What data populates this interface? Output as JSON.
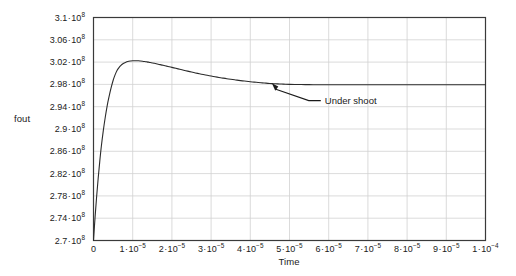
{
  "chart_data": {
    "type": "line",
    "title": "",
    "xlabel": "Time",
    "ylabel": "fout",
    "xlim": [
      0,
      0.0001
    ],
    "ylim": [
      270000000,
      310000000
    ],
    "grid": true,
    "legend": null,
    "x_tick_labels": [
      "0",
      "1·10⁻⁵",
      "2·10⁻⁵",
      "3·10⁻⁵",
      "4·10⁻⁵",
      "5·10⁻⁵",
      "6·10⁻⁵",
      "7·10⁻⁵",
      "8·10⁻⁵",
      "9·10⁻⁵",
      "1·10⁻⁴"
    ],
    "x_tick_values": [
      0,
      1e-05,
      2e-05,
      3e-05,
      4e-05,
      5e-05,
      6e-05,
      7e-05,
      8e-05,
      9e-05,
      0.0001
    ],
    "y_tick_labels": [
      "2.7·10⁸",
      "2.74·10⁸",
      "2.78·10⁸",
      "2.82·10⁸",
      "2.86·10⁸",
      "2.9·10⁸",
      "2.94·10⁸",
      "2.98·10⁸",
      "3.02·10⁸",
      "3.06·10⁸",
      "3.1·10⁸"
    ],
    "y_tick_values": [
      270000000,
      274000000,
      278000000,
      282000000,
      286000000,
      290000000,
      294000000,
      298000000,
      302000000,
      306000000,
      310000000
    ],
    "series": [
      {
        "name": "fout",
        "color": "#2b2b2b",
        "x": [
          0,
          4e-07,
          8e-07,
          1.2e-06,
          1.6e-06,
          2e-06,
          2.5e-06,
          3e-06,
          3.5e-06,
          4e-06,
          4.5e-06,
          5e-06,
          5.5e-06,
          6e-06,
          6.5e-06,
          7e-06,
          7.5e-06,
          8e-06,
          8.5e-06,
          9e-06,
          9.5e-06,
          1e-05,
          1.05e-05,
          1.1e-05,
          1.15e-05,
          1.2e-05,
          1.25e-05,
          1.3e-05,
          1.35e-05,
          1.4e-05,
          1.45e-05,
          1.5e-05,
          1.55e-05,
          1.6e-05,
          1.65e-05,
          1.7e-05,
          1.75e-05,
          1.8e-05,
          1.85e-05,
          1.9e-05,
          2e-05,
          2.1e-05,
          2.2e-05,
          2.3e-05,
          2.4e-05,
          2.5e-05,
          2.6e-05,
          2.7e-05,
          2.8e-05,
          2.9e-05,
          3e-05,
          3.1e-05,
          3.2e-05,
          3.3e-05,
          3.4e-05,
          3.5e-05,
          3.6e-05,
          3.7e-05,
          3.8e-05,
          3.9e-05,
          4e-05,
          4.1e-05,
          4.2e-05,
          4.3e-05,
          4.4e-05,
          4.5e-05,
          4.6e-05,
          4.7e-05,
          4.8e-05,
          4.9e-05,
          5e-05,
          5.2e-05,
          5.4e-05,
          5.6e-05,
          5.8e-05,
          6e-05,
          6.5e-05,
          7e-05,
          7.5e-05,
          8e-05,
          8.5e-05,
          9e-05,
          9.5e-05,
          0.0001
        ],
        "y": [
          270000000,
          274200000,
          277900000,
          281200000,
          284200000,
          286900000,
          289700000,
          292100000,
          294200000,
          295900000,
          297400000,
          298700000,
          299700000,
          300500000,
          301000000,
          301400000,
          301700000,
          301900000,
          302050000,
          302150000,
          302200000,
          302230000,
          302240000,
          302240000,
          302230000,
          302200000,
          302160000,
          302110000,
          302050000,
          301990000,
          301920000,
          301850000,
          301780000,
          301700000,
          301620000,
          301540000,
          301460000,
          301380000,
          301300000,
          301220000,
          301050000,
          300880000,
          300710000,
          300540000,
          300380000,
          300220000,
          300060000,
          299910000,
          299770000,
          299630000,
          299500000,
          299370000,
          299250000,
          299130000,
          299020000,
          298920000,
          298820000,
          298730000,
          298640000,
          298560000,
          298480000,
          298410000,
          298340000,
          298280000,
          298220000,
          298170000,
          298130000,
          298090000,
          298060000,
          298030000,
          298010000,
          297980000,
          297960000,
          297950000,
          297950000,
          297950000,
          297950000,
          297950000,
          297950000,
          297950000,
          297950000,
          297950000,
          297950000,
          297950000
        ]
      }
    ],
    "annotations": [
      {
        "name": "under-shoot",
        "text": "Under shoot",
        "target_x": 4.55e-05,
        "target_y": 298200000,
        "text_x": 5.85e-05,
        "text_y": 295100000
      }
    ]
  }
}
